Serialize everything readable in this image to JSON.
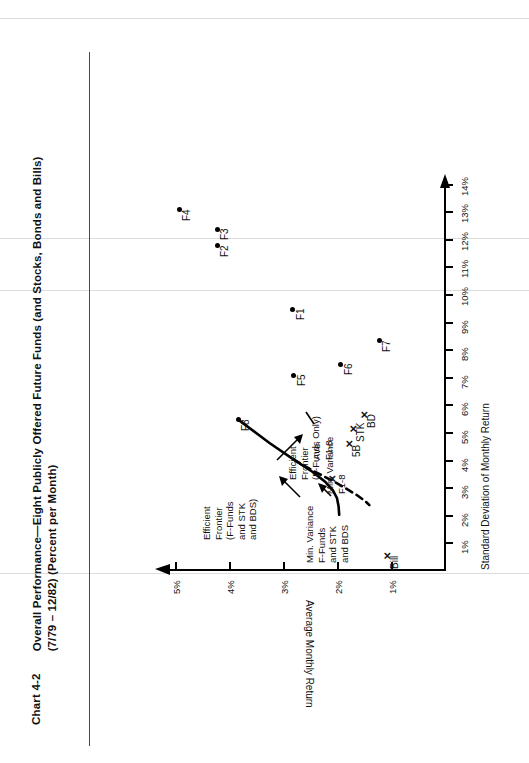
{
  "document": {
    "chart_number": "Chart 4-2",
    "title_line1": "Overall Performance—Eight Publicly Offered Future Funds (and Stocks, Bonds and Bills)",
    "title_line2": "(7/79 – 12/82) (Percent per Month)"
  },
  "chart_data": {
    "type": "scatter",
    "title": "Overall Performance—Eight Publicly Offered Future Funds (and Stocks, Bonds and Bills) (7/79 – 12/82) (Percent per Month)",
    "xlabel": "Standard Deviation of Monthly Return",
    "ylabel": "Average Monthly Return",
    "xlim": [
      0,
      14.6
    ],
    "ylim": [
      0,
      5.4
    ],
    "grid": false,
    "legend": "none",
    "x_ticks": [
      "1%",
      "2%",
      "3%",
      "4%",
      "5%",
      "6%",
      "7%",
      "8%",
      "9%",
      "10%",
      "11%",
      "12%",
      "13%",
      "14%"
    ],
    "x_tick_values": [
      1,
      2,
      3,
      4,
      5,
      6,
      7,
      8,
      9,
      10,
      11,
      12,
      13,
      14
    ],
    "y_ticks": [
      "1%",
      "2%",
      "3%",
      "4%",
      "5%"
    ],
    "y_tick_values": [
      1,
      2,
      3,
      4,
      5
    ],
    "marker_circle": "filled-circle",
    "marker_cross": "✕",
    "points": [
      {
        "label": "F1",
        "x": 9.45,
        "y": 2.82,
        "marker": "circle",
        "lab_dx": 6,
        "lab_dy": 3
      },
      {
        "label": "F2",
        "x": 11.75,
        "y": 4.22,
        "marker": "circle",
        "lab_dx": 6,
        "lab_dy": 3
      },
      {
        "label": "F3",
        "x": 12.35,
        "y": 4.22,
        "marker": "circle",
        "lab_dx": 6,
        "lab_dy": 3
      },
      {
        "label": "F4",
        "x": 13.05,
        "y": 4.92,
        "marker": "circle",
        "lab_dx": 6,
        "lab_dy": 3
      },
      {
        "label": "F5",
        "x": 7.05,
        "y": 2.8,
        "marker": "circle",
        "lab_dx": 6,
        "lab_dy": 3
      },
      {
        "label": "F6",
        "x": 7.45,
        "y": 1.93,
        "marker": "circle",
        "lab_dx": 6,
        "lab_dy": 3
      },
      {
        "label": "F7",
        "x": 8.3,
        "y": 1.22,
        "marker": "circle",
        "lab_dx": 5,
        "lab_dy": 3
      },
      {
        "label": "F8",
        "x": 5.45,
        "y": 3.83,
        "marker": "circle",
        "lab_dx": 6,
        "lab_dy": 3
      },
      {
        "label": "STK",
        "x": 5.05,
        "y": 1.7,
        "marker": "cross",
        "lab_dx": 6,
        "lab_dy": 3
      },
      {
        "label": "5B",
        "x": 4.5,
        "y": 1.77,
        "marker": "cross",
        "lab_dx": 6,
        "lab_dy": 3
      },
      {
        "label": "BD",
        "x": 5.55,
        "y": 1.5,
        "marker": "cross",
        "lab_dx": 6,
        "lab_dy": 3
      },
      {
        "label": "Bill",
        "x": 0.45,
        "y": 1.07,
        "marker": "cross",
        "lab_dx": 6,
        "lab_dy": 3
      },
      {
        "label": "Ave. F1-8",
        "x": 3.22,
        "y": 2.1,
        "marker": "cross",
        "lab_dx": 0,
        "lab_dy": 0
      }
    ],
    "annotations": [
      {
        "name": "efficient-frontier-all",
        "text": "Efficient\nFrontier\n(F-Funds\nand STK\nand BDS)"
      },
      {
        "name": "efficient-frontier-funds-only",
        "text": "Efficient\nFrontier\n(F-Funds Only)"
      },
      {
        "name": "min-variance-all",
        "text": "Min. Variance\nF-Funds\nand STK\nand BDS"
      },
      {
        "name": "min-variance-f18",
        "text": "Min. Variance\nF1-8"
      },
      {
        "name": "ave-f18",
        "text": "Ave.\nF1-8"
      }
    ],
    "curves": [
      {
        "name": "efficient-frontier-all",
        "style": "solid",
        "points": [
          [
            5.45,
            3.83
          ],
          [
            4.6,
            3.25
          ],
          [
            4.0,
            2.8
          ],
          [
            3.55,
            2.45
          ],
          [
            3.2,
            2.22
          ],
          [
            2.9,
            2.08
          ],
          [
            2.6,
            2.0
          ],
          [
            2.3,
            1.97
          ],
          [
            2.0,
            1.96
          ]
        ]
      },
      {
        "name": "efficient-frontier-funds-only",
        "style": "dashed",
        "points": [
          [
            4.0,
            2.8
          ],
          [
            3.6,
            2.45
          ],
          [
            3.25,
            2.1
          ],
          [
            2.95,
            1.83
          ],
          [
            2.7,
            1.62
          ],
          [
            2.5,
            1.48
          ],
          [
            2.35,
            1.4
          ]
        ]
      }
    ]
  }
}
